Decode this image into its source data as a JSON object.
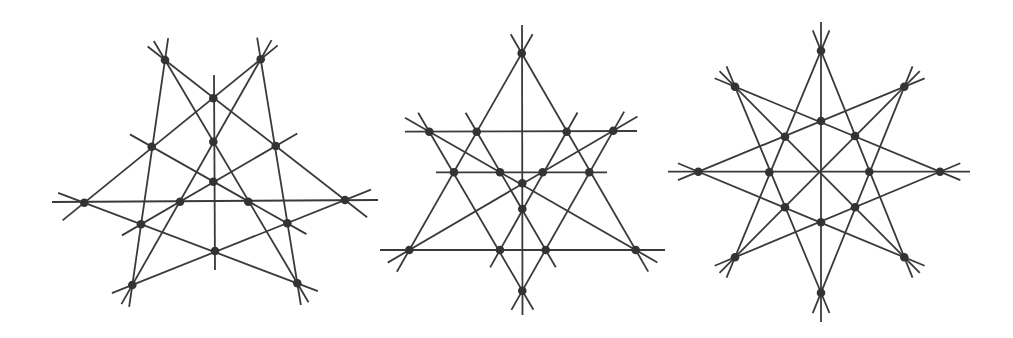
{
  "style": {
    "line_color": "#3a3a3a",
    "point_color": "#333333",
    "background": "#ffffff",
    "point_radius": 4.3
  },
  "figures": [
    {
      "name": "figure-1-pentagonal-configuration",
      "points": [
        [
          165,
          60
        ],
        [
          260.7,
          59.3
        ],
        [
          213.3,
          98.3
        ],
        [
          151.7,
          146.7
        ],
        [
          213.3,
          141.7
        ],
        [
          275.7,
          146
        ],
        [
          213.3,
          181.7
        ],
        [
          84.3,
          202.7
        ],
        [
          180,
          201.7
        ],
        [
          248.3,
          201.7
        ],
        [
          345,
          200
        ],
        [
          141,
          224.3
        ],
        [
          287.3,
          223.3
        ],
        [
          215,
          251
        ],
        [
          132.3,
          285
        ],
        [
          297.3,
          283.3
        ]
      ],
      "lines": [
        [
          [
            165,
            60
          ],
          [
            345,
            200
          ],
          22,
          28
        ],
        [
          [
            260.7,
            59.3
          ],
          [
            84.3,
            202.7
          ],
          22,
          28
        ],
        [
          [
            165,
            60
          ],
          [
            297.3,
            283.3
          ],
          22,
          22
        ],
        [
          [
            260.7,
            59.3
          ],
          [
            132.3,
            285
          ],
          22,
          22
        ],
        [
          [
            165,
            60
          ],
          [
            132.3,
            285
          ],
          22,
          22
        ],
        [
          [
            260.7,
            59.3
          ],
          [
            297.3,
            283.3
          ],
          22,
          22
        ],
        [
          [
            84.3,
            202.7
          ],
          [
            297.3,
            283.3
          ],
          28,
          22
        ],
        [
          [
            345,
            200
          ],
          [
            132.3,
            285
          ],
          28,
          22
        ],
        [
          [
            141,
            224.3
          ],
          [
            275.7,
            146
          ],
          22,
          25
        ],
        [
          [
            287.3,
            223.3
          ],
          [
            151.7,
            146.7
          ],
          22,
          25
        ],
        [
          [
            52,
            202
          ],
          [
            378,
            200
          ],
          0,
          0
        ],
        [
          [
            214,
            75
          ],
          [
            215,
            270
          ],
          0,
          0
        ]
      ]
    },
    {
      "name": "figure-2-triangular-configuration",
      "points": [
        [
          521.7,
          53.3
        ],
        [
          429.3,
          131.7
        ],
        [
          476.7,
          131.7
        ],
        [
          566.7,
          131.7
        ],
        [
          613.3,
          130.7
        ],
        [
          454,
          172.3
        ],
        [
          500,
          172.3
        ],
        [
          542.7,
          172.3
        ],
        [
          589.3,
          172.3
        ],
        [
          522.3,
          183.3
        ],
        [
          522.3,
          209
        ],
        [
          409.3,
          250
        ],
        [
          500,
          250
        ],
        [
          545.7,
          250
        ],
        [
          635.7,
          250
        ],
        [
          522.3,
          290.7
        ]
      ],
      "lines": [
        [
          [
            521.7,
            53.3
          ],
          [
            409.3,
            250
          ],
          22,
          25
        ],
        [
          [
            521.7,
            53.3
          ],
          [
            635.7,
            250
          ],
          22,
          25
        ],
        [
          [
            380,
            250
          ],
          [
            665,
            250
          ],
          0,
          0
        ],
        [
          [
            405,
            131.7
          ],
          [
            637,
            131
          ],
          0,
          0
        ],
        [
          [
            436,
            172.3
          ],
          [
            607,
            172.3
          ],
          0,
          0
        ],
        [
          [
            522,
            25
          ],
          [
            522.5,
            315
          ],
          0,
          0
        ],
        [
          [
            429.3,
            131.7
          ],
          [
            522.3,
            290.7
          ],
          22,
          22
        ],
        [
          [
            613.3,
            130.7
          ],
          [
            522.3,
            290.7
          ],
          22,
          22
        ],
        [
          [
            429.3,
            131.7
          ],
          [
            635.7,
            250
          ],
          28,
          25
        ],
        [
          [
            613.3,
            130.7
          ],
          [
            409.3,
            250
          ],
          28,
          25
        ],
        [
          [
            476.7,
            131.7
          ],
          [
            545.7,
            250
          ],
          22,
          20
        ],
        [
          [
            566.7,
            131.7
          ],
          [
            500,
            250
          ],
          22,
          20
        ]
      ]
    },
    {
      "name": "figure-3-octagonal-configuration",
      "points": [
        [
          821,
          50.7
        ],
        [
          735,
          86.7
        ],
        [
          904.3,
          86.7
        ],
        [
          821,
          121
        ],
        [
          785,
          136.7
        ],
        [
          855,
          136
        ],
        [
          698.3,
          171.7
        ],
        [
          769.3,
          172.3
        ],
        [
          869.3,
          171.7
        ],
        [
          940,
          171.7
        ],
        [
          785,
          207.3
        ],
        [
          855,
          207.3
        ],
        [
          821,
          222.3
        ],
        [
          735,
          257.3
        ],
        [
          904.3,
          257.3
        ],
        [
          821,
          292.7
        ]
      ],
      "lines": [
        [
          [
            821,
            50.7
          ],
          [
            735,
            257.3
          ],
          22,
          22
        ],
        [
          [
            821,
            50.7
          ],
          [
            904.3,
            257.3
          ],
          22,
          22
        ],
        [
          [
            821,
            292.7
          ],
          [
            735,
            86.7
          ],
          22,
          22
        ],
        [
          [
            821,
            292.7
          ],
          [
            904.3,
            86.7
          ],
          22,
          22
        ],
        [
          [
            698.3,
            171.7
          ],
          [
            904.3,
            86.7
          ],
          22,
          22
        ],
        [
          [
            698.3,
            171.7
          ],
          [
            904.3,
            257.3
          ],
          22,
          22
        ],
        [
          [
            940,
            171.7
          ],
          [
            735,
            86.7
          ],
          22,
          22
        ],
        [
          [
            940,
            171.7
          ],
          [
            735,
            257.3
          ],
          22,
          22
        ],
        [
          [
            735,
            86.7
          ],
          [
            904.3,
            257.3
          ],
          22,
          22
        ],
        [
          [
            904.3,
            86.7
          ],
          [
            735,
            257.3
          ],
          22,
          22
        ],
        [
          [
            668,
            171.7
          ],
          [
            970,
            171.7
          ],
          0,
          0
        ],
        [
          [
            821,
            22
          ],
          [
            821,
            322
          ],
          0,
          0
        ]
      ]
    }
  ]
}
